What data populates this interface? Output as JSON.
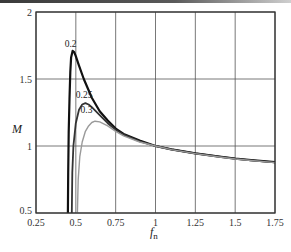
{
  "chart_data": {
    "type": "line",
    "title": "",
    "xlabel": "f_n",
    "xlabel_main": "f",
    "xlabel_sub": "n",
    "ylabel": "M",
    "xlim": [
      0.25,
      1.75
    ],
    "ylim": [
      0.5,
      2
    ],
    "grid": true,
    "x_ticks": [
      "0.25",
      "0.5",
      "0.75",
      "1",
      "1.25",
      "1.5",
      "1.75"
    ],
    "y_ticks": [
      "0.5",
      "1",
      "1.5",
      "2"
    ],
    "series": [
      {
        "name": "0.2",
        "color": "#111111",
        "width": 2.2,
        "label_pos": [
          0.43,
          1.74
        ],
        "points": [
          [
            0.45,
            0.5
          ],
          [
            0.452,
            0.8
          ],
          [
            0.455,
            1.1
          ],
          [
            0.46,
            1.35
          ],
          [
            0.465,
            1.55
          ],
          [
            0.47,
            1.66
          ],
          [
            0.48,
            1.71
          ],
          [
            0.49,
            1.7
          ],
          [
            0.5,
            1.67
          ],
          [
            0.52,
            1.6
          ],
          [
            0.55,
            1.5
          ],
          [
            0.6,
            1.36
          ],
          [
            0.65,
            1.26
          ],
          [
            0.7,
            1.19
          ],
          [
            0.75,
            1.13
          ],
          [
            0.8,
            1.09
          ],
          [
            0.9,
            1.04
          ],
          [
            1.0,
            1.0
          ],
          [
            1.1,
            0.975
          ],
          [
            1.25,
            0.945
          ],
          [
            1.4,
            0.92
          ],
          [
            1.5,
            0.905
          ],
          [
            1.6,
            0.895
          ],
          [
            1.75,
            0.88
          ]
        ]
      },
      {
        "name": "0.25",
        "color": "#333333",
        "width": 1.8,
        "label_pos": [
          0.5,
          1.36
        ],
        "points": [
          [
            0.475,
            0.5
          ],
          [
            0.478,
            0.8
          ],
          [
            0.485,
            1.0
          ],
          [
            0.5,
            1.17
          ],
          [
            0.52,
            1.27
          ],
          [
            0.54,
            1.31
          ],
          [
            0.56,
            1.32
          ],
          [
            0.58,
            1.31
          ],
          [
            0.6,
            1.29
          ],
          [
            0.65,
            1.23
          ],
          [
            0.7,
            1.17
          ],
          [
            0.75,
            1.12
          ],
          [
            0.8,
            1.085
          ],
          [
            0.9,
            1.035
          ],
          [
            1.0,
            1.0
          ],
          [
            1.1,
            0.975
          ],
          [
            1.25,
            0.945
          ],
          [
            1.4,
            0.92
          ],
          [
            1.5,
            0.905
          ],
          [
            1.6,
            0.893
          ],
          [
            1.75,
            0.878
          ]
        ]
      },
      {
        "name": "0.3",
        "color": "#9a9a9a",
        "width": 1.4,
        "label_pos": [
          0.53,
          1.25
        ],
        "points": [
          [
            0.51,
            0.5
          ],
          [
            0.515,
            0.75
          ],
          [
            0.525,
            0.92
          ],
          [
            0.54,
            1.03
          ],
          [
            0.56,
            1.11
          ],
          [
            0.58,
            1.15
          ],
          [
            0.6,
            1.175
          ],
          [
            0.62,
            1.185
          ],
          [
            0.65,
            1.18
          ],
          [
            0.7,
            1.15
          ],
          [
            0.75,
            1.11
          ],
          [
            0.8,
            1.075
          ],
          [
            0.9,
            1.03
          ],
          [
            1.0,
            1.0
          ],
          [
            1.1,
            0.973
          ],
          [
            1.25,
            0.943
          ],
          [
            1.4,
            0.918
          ],
          [
            1.5,
            0.903
          ],
          [
            1.6,
            0.892
          ],
          [
            1.75,
            0.876
          ]
        ]
      }
    ]
  }
}
